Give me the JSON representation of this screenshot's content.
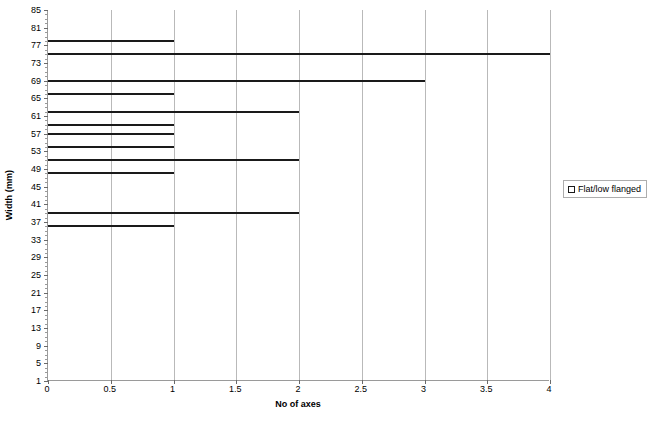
{
  "chart_data": {
    "type": "bar",
    "orientation": "horizontal",
    "title": "",
    "xlabel": "No of axes",
    "ylabel": "Width (mm)",
    "xlim": [
      0,
      4
    ],
    "ylim": [
      1,
      85
    ],
    "x_ticks": [
      "0",
      "0.5",
      "1",
      "1.5",
      "2",
      "2.5",
      "3",
      "3.5",
      "4"
    ],
    "x_tick_values": [
      0,
      0.5,
      1,
      1.5,
      2,
      2.5,
      3,
      3.5,
      4
    ],
    "y_ticks": [
      "1",
      "5",
      "9",
      "13",
      "17",
      "21",
      "25",
      "29",
      "33",
      "37",
      "41",
      "45",
      "49",
      "53",
      "57",
      "61",
      "65",
      "69",
      "73",
      "77",
      "81",
      "85"
    ],
    "y_tick_values": [
      1,
      5,
      9,
      13,
      17,
      21,
      25,
      29,
      33,
      37,
      41,
      45,
      49,
      53,
      57,
      61,
      65,
      69,
      73,
      77,
      81,
      85
    ],
    "grid": "vertical-only",
    "legend_position": "right",
    "series": [
      {
        "name": "Flat/low flanged",
        "marker": "open-square",
        "color": "#1a1a1a",
        "points": [
          {
            "width_mm": 78,
            "no_of_axes": 1
          },
          {
            "width_mm": 75,
            "no_of_axes": 4
          },
          {
            "width_mm": 69,
            "no_of_axes": 3
          },
          {
            "width_mm": 66,
            "no_of_axes": 1
          },
          {
            "window": "",
            "width_mm": 62,
            "no_of_axes": 2
          },
          {
            "width_mm": 59,
            "no_of_axes": 1
          },
          {
            "width_mm": 57,
            "no_of_axes": 1
          },
          {
            "width_mm": 54,
            "no_of_axes": 1
          },
          {
            "width_mm": 51,
            "no_of_axes": 2
          },
          {
            "width_mm": 48,
            "no_of_axes": 1
          },
          {
            "width_mm": 39,
            "no_of_axes": 2
          },
          {
            "width_mm": 36,
            "no_of_axes": 1
          }
        ]
      }
    ]
  },
  "legend": {
    "entries": [
      {
        "label": "Flat/low flanged",
        "marker": "open-square"
      }
    ]
  }
}
